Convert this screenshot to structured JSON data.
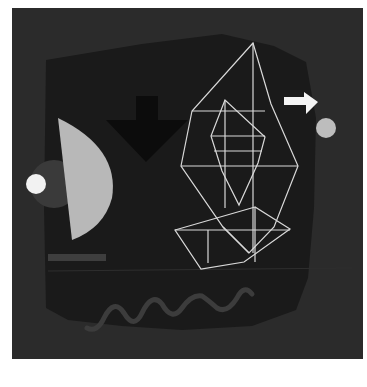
{
  "artwork": {
    "description": "Abstract geometric painting on dark ground",
    "colors": {
      "background": "#ffffff",
      "outer_ground": "#2b2b2b",
      "inner_panel": "#1a1a1a",
      "arrow_down": "#0c0c0c",
      "half_moon": "#b8b8b8",
      "left_dot": "#f2f2f2",
      "halo": "#3a3a3a",
      "right_dot": "#bdbdbd",
      "arrow_right": "#f4f4f4",
      "wireframe": "#d9d9d9",
      "wave": "#3c3c3c",
      "bar": "#3e3e3e"
    },
    "elements": [
      "down-arrow",
      "right-arrow",
      "half-moon",
      "left-dot",
      "right-dot",
      "wireframe-crystal",
      "wave-line",
      "horizontal-bar"
    ]
  }
}
